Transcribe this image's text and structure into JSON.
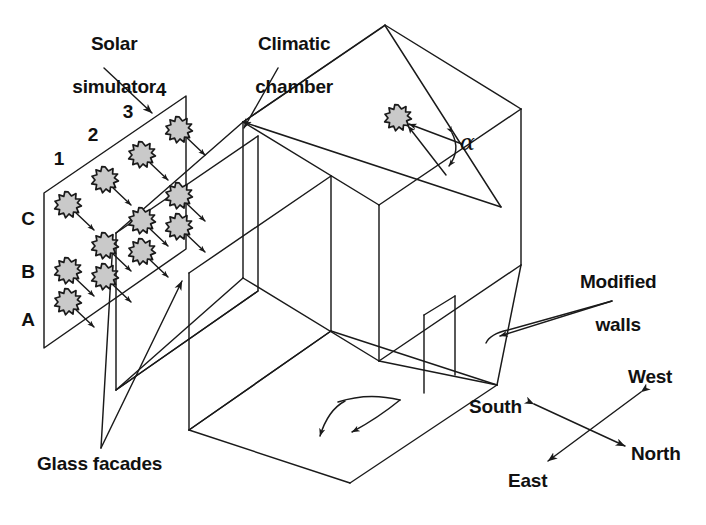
{
  "figure": {
    "kind": "isometric-schematic",
    "background_color": "#ffffff",
    "line_color": "#1a1a1a",
    "text_color": "#111111",
    "lamp_fill": "#c9c9c9",
    "lamp_stroke": "#1a1a1a"
  },
  "labels": {
    "solar_simulator_line1": "Solar",
    "solar_simulator_line2": "simulator",
    "climatic_chamber_line1": "Climatic",
    "climatic_chamber_line2": "chamber",
    "modified_walls_line1": "Modified",
    "modified_walls_line2": "walls",
    "glass_facades": "Glass facades",
    "angle_symbol": "α"
  },
  "lamp_grid": {
    "row_labels": [
      "C",
      "B",
      "A"
    ],
    "column_labels": [
      "1",
      "2",
      "3",
      "4"
    ],
    "rows": 3,
    "columns": 4,
    "total_lamps": 12,
    "cells": [
      {
        "row": "C",
        "column": "1"
      },
      {
        "row": "C",
        "column": "2"
      },
      {
        "row": "C",
        "column": "3"
      },
      {
        "row": "C",
        "column": "4"
      },
      {
        "row": "B",
        "column": "1"
      },
      {
        "row": "B",
        "column": "2"
      },
      {
        "row": "B",
        "column": "3"
      },
      {
        "row": "B",
        "column": "4"
      },
      {
        "row": "A",
        "column": "1"
      },
      {
        "row": "A",
        "column": "2"
      },
      {
        "row": "A",
        "column": "3"
      },
      {
        "row": "A",
        "column": "4"
      }
    ]
  },
  "compass": {
    "north": "North",
    "south": "South",
    "east": "East",
    "west": "West"
  },
  "callouts": [
    {
      "name": "solar-simulator",
      "text": "Solar simulator"
    },
    {
      "name": "climatic-chamber",
      "text": "Climatic chamber"
    },
    {
      "name": "modified-walls",
      "text": "Modified walls"
    },
    {
      "name": "glass-facades",
      "text": "Glass facades"
    },
    {
      "name": "incidence-angle",
      "text": "α"
    }
  ]
}
